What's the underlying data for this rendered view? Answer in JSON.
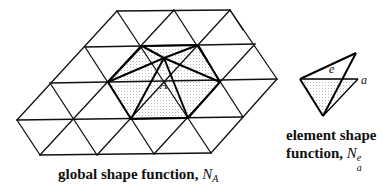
{
  "global_caption": {
    "text": "global shape function, ",
    "symbol": "N",
    "subscript": "A"
  },
  "element_caption": {
    "line1": "element shape",
    "line2": "function, ",
    "symbol": "N",
    "subscript": "a",
    "superscript": "e"
  },
  "labels": {
    "node_A": "A",
    "element_e": "e",
    "node_a": "a"
  },
  "colors": {
    "line": "#111111",
    "stipple": "#888888",
    "background": "#ffffff"
  }
}
